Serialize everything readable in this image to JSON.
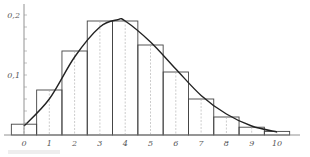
{
  "chart_data": {
    "type": "bar",
    "subtype": "histogram-with-density-curve",
    "title": "",
    "xlabel": "",
    "ylabel": "",
    "categories": [
      "0",
      "1",
      "2",
      "3",
      "4",
      "5",
      "6",
      "7",
      "8",
      "9",
      "10"
    ],
    "series": [
      {
        "name": "histogram",
        "values": [
          0.018,
          0.075,
          0.14,
          0.19,
          0.19,
          0.15,
          0.105,
          0.06,
          0.03,
          0.013,
          0.006
        ]
      },
      {
        "name": "fitted curve",
        "type": "line",
        "x": [
          0,
          1,
          2,
          3,
          3.7,
          4,
          5,
          6,
          7,
          8,
          9,
          10
        ],
        "values": [
          0.015,
          0.06,
          0.13,
          0.18,
          0.192,
          0.19,
          0.155,
          0.11,
          0.066,
          0.035,
          0.015,
          0.005
        ]
      }
    ],
    "x_ticks": [
      "0",
      "1",
      "2",
      "3",
      "4",
      "5",
      "6",
      "7",
      "8",
      "9",
      "10"
    ],
    "y_ticks": [
      "0,1",
      "0,2"
    ],
    "xlim": [
      -0.5,
      10.5
    ],
    "ylim": [
      0,
      0.2
    ],
    "grid": false,
    "legend": null
  },
  "colors": {
    "bars": "#444444",
    "curve": "#222222",
    "axis": "#777777",
    "labels": "#555555"
  }
}
